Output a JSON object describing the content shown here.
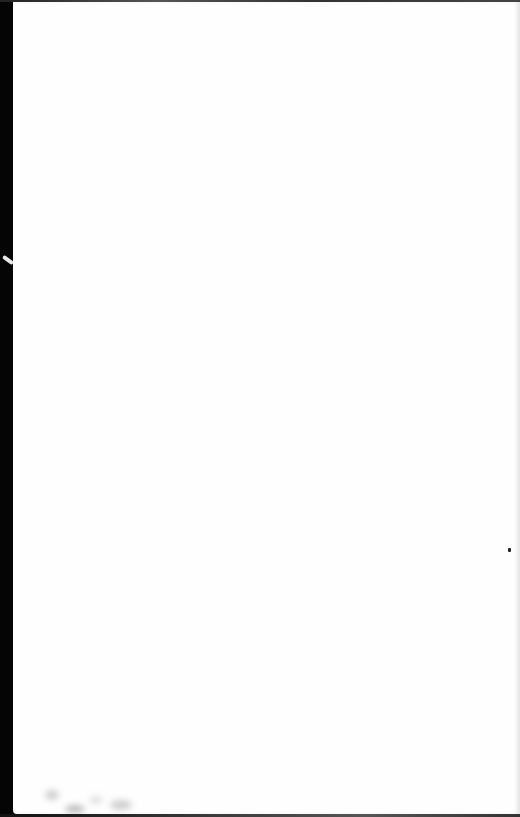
{
  "document": {
    "type": "scanned-page",
    "content": "blank",
    "text": "",
    "colors": {
      "page": "#fefefe",
      "scan_border": "#0c0c0c"
    }
  }
}
